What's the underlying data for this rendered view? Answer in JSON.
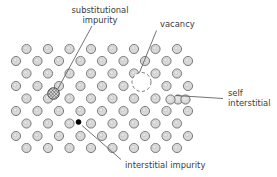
{
  "figure": {
    "background_color": "#ffffff"
  },
  "lattice": {
    "atom_fill": "#d6d6d6",
    "atom_stroke": "#6b6b6b",
    "atom_radius": 4.6,
    "atom_inner_fill": "#e8e8e8",
    "row_spacing": 12.6,
    "col_spacing": 21.5,
    "rows": [
      {
        "index": 0,
        "y": 49.0,
        "x_start": 26.5,
        "count": 8,
        "offset": 0
      },
      {
        "index": 1,
        "y": 61.0,
        "x_start": 16.0,
        "count": 9,
        "offset": 1
      },
      {
        "index": 2,
        "y": 73.5,
        "x_start": 26.5,
        "count": 8,
        "offset": 0
      },
      {
        "index": 3,
        "y": 86.0,
        "x_start": 16.0,
        "count": 9,
        "offset": 1
      },
      {
        "index": 4,
        "y": 98.5,
        "x_start": 26.5,
        "count": 8,
        "offset": 0
      },
      {
        "index": 5,
        "y": 111.0,
        "x_start": 16.0,
        "count": 9,
        "offset": 1
      },
      {
        "index": 6,
        "y": 123.5,
        "x_start": 26.5,
        "count": 8,
        "offset": 0
      },
      {
        "index": 7,
        "y": 136.0,
        "x_start": 16.0,
        "count": 9,
        "offset": 1
      },
      {
        "index": 8,
        "y": 148.0,
        "x_start": 26.5,
        "count": 8,
        "offset": 0
      }
    ]
  },
  "defects": {
    "substitutional_impurity": {
      "label": "substitutional\nimpurity",
      "label_line1": "substitutional",
      "label_line2": "impurity",
      "label_x": 100,
      "label_y": 13,
      "marker_x": 53.5,
      "marker_y": 93.5,
      "marker_radius": 5.6,
      "marker_style": "cross-hatched",
      "marker_fill": "#b9b9b9",
      "leader_from": [
        92,
        26
      ],
      "leader_to": [
        57,
        89
      ]
    },
    "vacancy": {
      "label": "vacancy",
      "label_x": 160,
      "label_y": 27,
      "marker_x": 141.5,
      "marker_y": 82.0,
      "marker_radius": 9.5,
      "marker_style": "dashed-empty",
      "leader_from": [
        156,
        31
      ],
      "leader_to": [
        139,
        72
      ]
    },
    "self_interstitial": {
      "label_line1": "self",
      "label_line2": "interstitial",
      "label_x": 228,
      "label_y": 95,
      "marker_x": 178.0,
      "marker_y": 99.5,
      "marker_radius": 4.6,
      "marker_style": "extra-atom-pair",
      "leader_from": [
        224,
        99
      ],
      "leader_to": [
        176,
        96
      ]
    },
    "interstitial_impurity": {
      "label": "interstitial impurity",
      "label_x": 137,
      "label_y": 167,
      "marker_x": 78.5,
      "marker_y": 122.0,
      "marker_radius": 2.4,
      "marker_style": "solid-black",
      "marker_fill": "#000000",
      "leader_from": [
        122,
        160
      ],
      "leader_to": [
        82,
        126
      ]
    }
  },
  "colors": {
    "leader_line": "#5a5a5a",
    "text": "#3a3a3a",
    "atom_fill": "#d6d6d6",
    "atom_stroke": "#6b6b6b"
  }
}
